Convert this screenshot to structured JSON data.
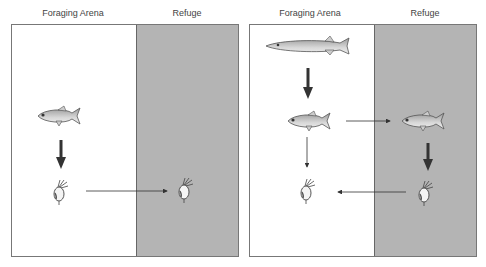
{
  "panels": [
    {
      "id": "without-predator",
      "labels": {
        "arena": "Foraging Arena",
        "refuge": "Refuge"
      },
      "organisms": [
        "small-fish",
        "zooplankton-arena",
        "zooplankton-refuge"
      ],
      "arrows": [
        {
          "from": "small-fish",
          "to": "zooplankton-arena",
          "weight": "strong"
        },
        {
          "from": "zooplankton-arena",
          "to": "zooplankton-refuge",
          "weight": "thin"
        }
      ]
    },
    {
      "id": "with-predator",
      "labels": {
        "arena": "Foraging Arena",
        "refuge": "Refuge"
      },
      "organisms": [
        "pike",
        "small-fish-arena",
        "small-fish-refuge",
        "zooplankton-arena",
        "zooplankton-refuge"
      ],
      "arrows": [
        {
          "from": "pike",
          "to": "small-fish-arena",
          "weight": "strong"
        },
        {
          "from": "small-fish-arena",
          "to": "small-fish-refuge",
          "weight": "thin"
        },
        {
          "from": "small-fish-arena",
          "to": "zooplankton-arena",
          "weight": "thin"
        },
        {
          "from": "small-fish-refuge",
          "to": "zooplankton-refuge",
          "weight": "strong"
        },
        {
          "from": "zooplankton-refuge",
          "to": "zooplankton-arena",
          "weight": "thin"
        }
      ]
    }
  ],
  "colors": {
    "refuge": "#b4b4b4",
    "arena": "#ffffff",
    "arrow": "#333333"
  }
}
